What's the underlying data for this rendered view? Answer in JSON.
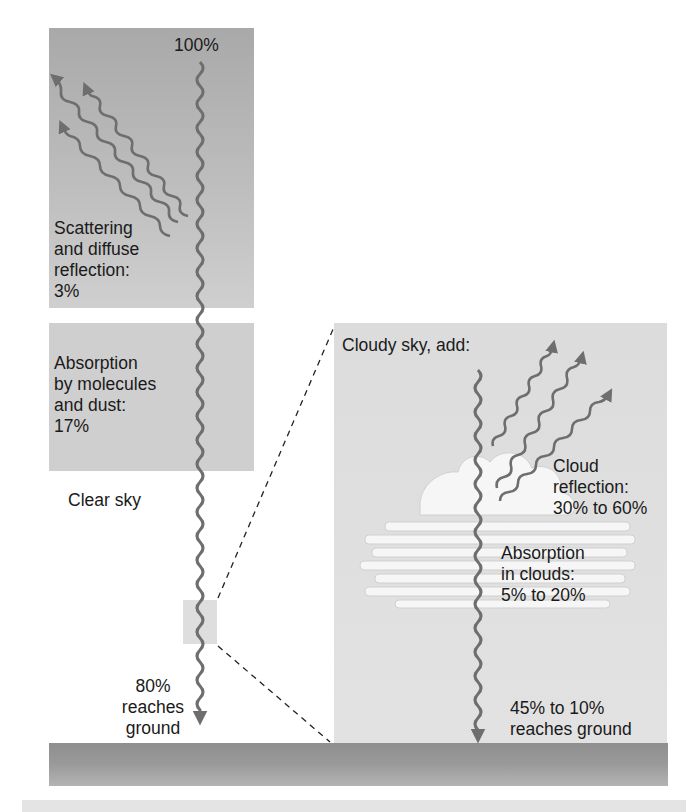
{
  "diagram": {
    "colors": {
      "wave": "#6e6e6e",
      "top_box": "#b3b3b3",
      "absorption_box": "#cfcfcf",
      "cloudy_box": "#dedede",
      "ground": "#969696",
      "cloud": "#f4f4f4",
      "text": "#1a1a1a"
    },
    "clear_sky": {
      "label": "Clear sky",
      "incoming": "100%",
      "scattering": {
        "text": "Scattering\nand diffuse\nreflection:\n3%",
        "value": "3%"
      },
      "absorption": {
        "text": "Absorption\nby molecules\nand dust:\n17%",
        "value": "17%"
      },
      "ground": {
        "text": "80%\nreaches\nground",
        "value": "80%"
      }
    },
    "cloudy_sky": {
      "heading": "Cloudy sky, add:",
      "cloud_reflection": {
        "text": "Cloud\nreflection:\n30% to 60%",
        "range": "30% to 60%"
      },
      "cloud_absorption": {
        "text": "Absorption\nin clouds:\n5% to 20%",
        "range": "5% to 20%"
      },
      "ground": {
        "text": "45% to 10%\nreaches ground",
        "range": "45% to 10%"
      }
    }
  }
}
